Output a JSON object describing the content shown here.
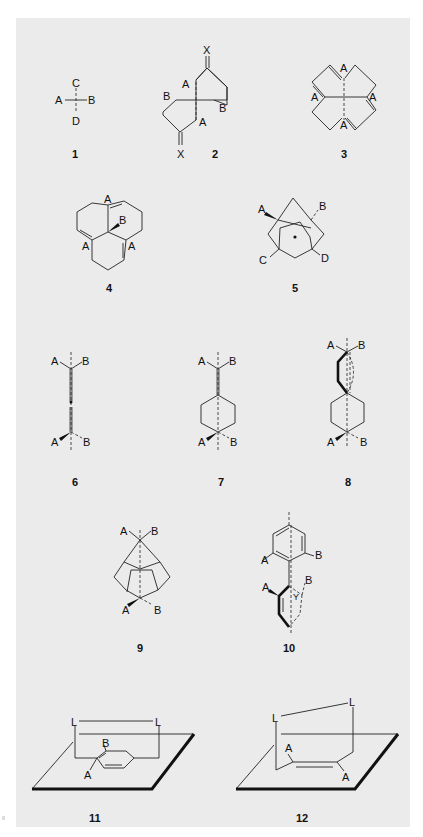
{
  "figure": {
    "background_color": "#ebebeb",
    "page_color": "#ffffff",
    "line_color": "#222222"
  },
  "structures": [
    {
      "id": "1",
      "number_label": "1",
      "atom_labels": [
        "C",
        "A",
        "B",
        "D"
      ]
    },
    {
      "id": "2",
      "number_label": "2",
      "atom_labels": [
        "X",
        "A",
        "B",
        "B",
        "A",
        "X"
      ]
    },
    {
      "id": "3",
      "number_label": "3",
      "atom_labels": [
        "A",
        "A",
        "A",
        "A"
      ]
    },
    {
      "id": "4",
      "number_label": "4",
      "atom_labels": [
        "A",
        "B",
        "A",
        "A"
      ]
    },
    {
      "id": "5",
      "number_label": "5",
      "atom_labels": [
        "A",
        "B",
        "C",
        "D"
      ]
    },
    {
      "id": "6",
      "number_label": "6",
      "atom_labels": [
        "A",
        "B",
        "A",
        "B"
      ]
    },
    {
      "id": "7",
      "number_label": "7",
      "atom_labels": [
        "A",
        "B",
        "A",
        "B"
      ]
    },
    {
      "id": "8",
      "number_label": "8",
      "atom_labels": [
        "A",
        "B",
        "A",
        "B"
      ]
    },
    {
      "id": "9",
      "number_label": "9",
      "atom_labels": [
        "A",
        "B",
        "A",
        "B"
      ]
    },
    {
      "id": "10",
      "number_label": "10",
      "atom_labels": [
        "A",
        "B",
        "A",
        "Y",
        "B"
      ]
    },
    {
      "id": "11",
      "number_label": "11",
      "atom_labels": [
        "L",
        "L",
        "B",
        "A"
      ]
    },
    {
      "id": "12",
      "number_label": "12",
      "atom_labels": [
        "L",
        "L",
        "A",
        "A"
      ]
    }
  ]
}
